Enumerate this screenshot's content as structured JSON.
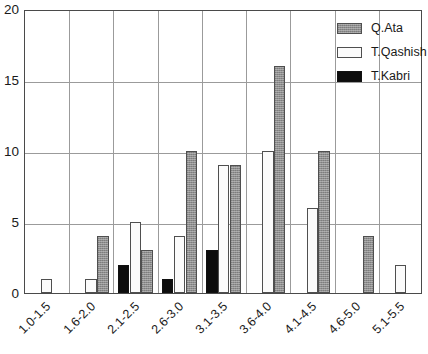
{
  "chart_data": {
    "type": "bar",
    "title": "",
    "subtitle": "",
    "xlabel": "",
    "ylabel": "",
    "grid": true,
    "legend_position": "top-right",
    "ylim": [
      0,
      20
    ],
    "yticks": [
      0,
      5,
      10,
      15,
      20
    ],
    "ytick_labels": [
      "0",
      "5",
      "10",
      "15",
      "20"
    ],
    "categories": [
      "1.0-1.5",
      "1.6-2.0",
      "2.1-2.5",
      "2.6-3.0",
      "3.1-3.5",
      "3.6-4.0",
      "4.1-4.5",
      "4.6-5.0",
      "5.1-5.5"
    ],
    "series": [
      {
        "name": "T.Kabri",
        "color": "#0d0d0d",
        "values": [
          0,
          0,
          2,
          1,
          3,
          0,
          0,
          0,
          0
        ]
      },
      {
        "name": "T.Qashish",
        "color": "#fbfbfb",
        "values": [
          1,
          1,
          5,
          4,
          9,
          10,
          6,
          0,
          2
        ]
      },
      {
        "name": "Q.Ata",
        "color": "#8e8e8e",
        "values": [
          0,
          4,
          3,
          10,
          9,
          16,
          10,
          4,
          0
        ]
      }
    ]
  },
  "legend": {
    "entries": [
      {
        "label": "Q.Ata",
        "swatch": "ata"
      },
      {
        "label": "T.Qashish",
        "swatch": "qashish"
      },
      {
        "label": "T.Kabri",
        "swatch": "kabri"
      }
    ]
  }
}
